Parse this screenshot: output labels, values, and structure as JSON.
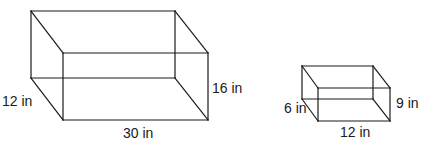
{
  "diagram": {
    "type": "rectangular-prisms",
    "stroke_color": "#1a1a1a",
    "boxes": [
      {
        "id": "large",
        "length_label": "30 in",
        "width_label": "12 in",
        "height_label": "16 in",
        "length": 30,
        "width": 12,
        "height": 16,
        "unit": "in"
      },
      {
        "id": "small",
        "length_label": "12 in",
        "width_label": "6 in",
        "height_label": "9 in",
        "length": 12,
        "width": 6,
        "height": 9,
        "unit": "in"
      }
    ]
  }
}
